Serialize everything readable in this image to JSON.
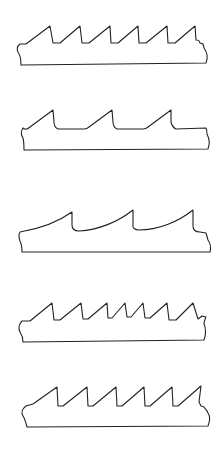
{
  "figure": {
    "width": 224,
    "height": 462,
    "background": "#ffffff",
    "stroke_color": "#222222"
  },
  "blades": [
    {
      "name": "blade-profile-regular-tooth",
      "tooth_count": 6,
      "path": "M 21 65 L 206 63 C 208 58, 207 52, 204 48 L 203 44 L 200 43 C 199 40, 198 40, 196 40 L 195 26 L 175 43 L 168 43 L 167 26 L 146 43 L 139 43 L 138 26 L 118 43 L 111 43 L 110 26 L 89 43 L 82 43 L 80 26 L 60 43 L 53 43 L 50 26 L 26 44 L 20 44 C 17 46, 16 50, 19 54 C 21 57, 21 61, 21 65 Z"
    },
    {
      "name": "blade-profile-skip-tooth",
      "tooth_count": 3,
      "path": "M 24 150 L 208 149 C 210 144, 209 138, 207 134 C 207 132, 207 130, 206 128 L 176 129 C 174 128, 172 126, 171 122 L 171 110 L 148 127 C 146 129, 145 129, 143 129 L 117 129 C 115 128, 113 126, 113 122 L 112 110 L 89 127 C 87 129, 86 129, 84 129 L 58 129 C 56 128, 54 126, 54 122 L 53 110 L 30 127 C 27 130, 25 130, 23 128 C 21 131, 21 135, 23 138 C 24 142, 24 146, 24 150 Z"
    },
    {
      "name": "blade-profile-hook-tooth",
      "tooth_count": 3,
      "path": "M 22 252 L 210 252 C 211 248, 211 244, 208 240 L 206 233 L 200 232 C 195 232, 193 230, 193 226 L 193 210 C 178 222, 158 230, 139 230 C 135 230, 132 228, 133 224 L 133 210 C 118 222, 98 230, 79 231 C 74 231, 72 229, 72 225 L 72 212 C 58 222, 38 229, 20 232 C 18 235, 19 238, 20 241 C 22 245, 22 248, 22 252 Z"
    },
    {
      "name": "blade-profile-variable-pitch-tooth",
      "tooth_count": 7,
      "path": "M 23 342 L 204 340 C 206 335, 206 328, 204 324 C 204 321, 205 319, 206 317 L 202 316 L 198 319 L 193 303 L 176 320 L 169 320 L 167 303 L 150 318 L 145 318 L 143 303 L 131 317 L 127 317 L 125 303 L 112 318 L 108 318 L 107 303 L 88 319 L 83 319 L 81 303 L 60 320 L 54 320 L 52 303 L 30 321 L 22 321 C 19 324, 18 329, 20 332 C 22 335, 23 338, 23 342 Z"
    },
    {
      "name": "blade-profile-raker-set-tooth",
      "tooth_count": 6,
      "path": "M 27 427 L 208 426 C 210 421, 210 416, 208 413 C 207 410, 205 409, 204 407 L 201 406 L 199 402 L 201 386 L 178 406 L 173 406 L 172 387 L 150 406 L 145 406 L 144 387 L 122 406 L 117 406 L 116 387 L 93 406 L 88 406 L 87 387 L 63 406 L 58 406 L 57 387 L 33 404 L 26 406 C 22 409, 21 413, 23 416 C 25 419, 26 423, 27 427 Z"
    }
  ]
}
